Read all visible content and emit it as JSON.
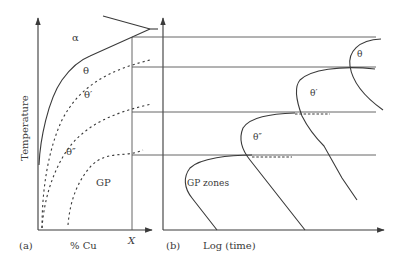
{
  "panel_a": {
    "caption": "(a)",
    "x_axis_label": "% Cu",
    "y_axis_label": "Temperature",
    "x_marker_label": "X",
    "region_labels": {
      "alpha": "α",
      "theta": "θ",
      "theta_prime": "θ′",
      "theta_double_prime": "θ″",
      "gp": "GP"
    },
    "curves": [
      {
        "name": "θ solvus",
        "style": "solid"
      },
      {
        "name": "θ′ solvus",
        "style": "dotted"
      },
      {
        "name": "θ″ solvus",
        "style": "dotted"
      },
      {
        "name": "GP solvus",
        "style": "dotted"
      }
    ]
  },
  "panel_b": {
    "caption": "(b)",
    "x_axis_label": "Log (time)",
    "curve_labels": {
      "theta": "θ",
      "theta_prime": "θ′",
      "theta_double_prime": "θ″",
      "gp_zones": "GP zones"
    },
    "curves": [
      {
        "name": "θ C-curve",
        "style": "solid"
      },
      {
        "name": "θ′ C-curve",
        "style": "solid"
      },
      {
        "name": "θ″ C-curve",
        "style": "solid"
      },
      {
        "name": "GP zones C-curve",
        "style": "solid"
      }
    ]
  },
  "colors": {
    "line": "#3a3a3a",
    "background": "#ffffff"
  }
}
